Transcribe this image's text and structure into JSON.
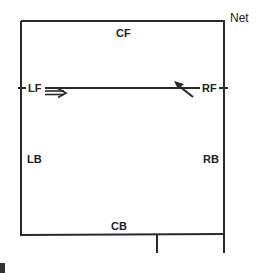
{
  "diagram": {
    "type": "volleyball court positions",
    "net_label": "Net",
    "positions": {
      "center_front": "CF",
      "left_front": "LF",
      "right_front": "RF",
      "left_back": "LB",
      "right_back": "RB",
      "center_back": "CB"
    },
    "annotations": {
      "lf_arrow": "double-arrow-right",
      "rf_arrow": "arrow-up-left"
    },
    "colors": {
      "line": "#2a2a2a",
      "text": "#222222",
      "background": "#ffffff"
    }
  }
}
